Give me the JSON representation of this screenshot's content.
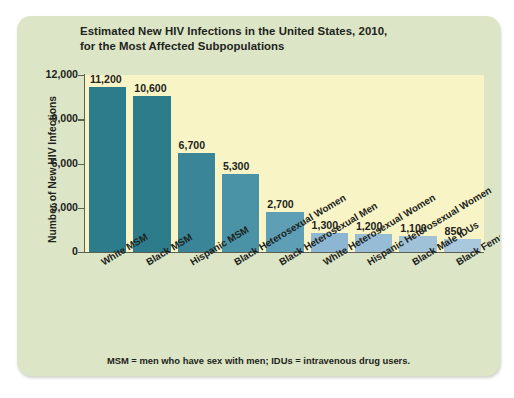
{
  "chart_data": {
    "type": "bar",
    "title": "Estimated New HIV Infections in the United States, 2010, for the Most Affected Subpopulations",
    "title_line1": "Estimated New HIV Infections in the United States, 2010,",
    "title_line2": "for the Most Affected Subpopulations",
    "xlabel": "",
    "ylabel": "Number of New HIV Infections",
    "ylim": [
      0,
      12000
    ],
    "grid": false,
    "legend": "none",
    "ytick_labels": [
      "12,000",
      "9,000",
      "6,000",
      "3,000",
      "0"
    ],
    "ytick_values": [
      12000,
      9000,
      6000,
      3000,
      0
    ],
    "categories": [
      "White MSM",
      "Black MSM",
      "Hispanic MSM",
      "Black Heterosexual Women",
      "Black Heterosexual Men",
      "White Heterosexual Women",
      "Hispanic Heterosexual Women",
      "Black Male IDUs",
      "Black Female IDUs"
    ],
    "values": [
      11200,
      10600,
      6700,
      5300,
      2700,
      1300,
      1200,
      1100,
      850
    ],
    "value_labels": [
      "11,200",
      "10,600",
      "6,700",
      "5,300",
      "2,700",
      "1,300",
      "1,200",
      "1,100",
      "850"
    ],
    "bar_colors": [
      "#2d7c8b",
      "#2d7c8b",
      "#3b8599",
      "#4a92a6",
      "#5e9fb6",
      "#8cb6d2",
      "#97bdd6",
      "#a0c2d9",
      "#a9c8de"
    ],
    "annotation": "MSM = men who have sex with men; IDUs = intravenous drug users."
  },
  "colors": {
    "card_background": "#dce5c6",
    "plot_background": "#f8f4c6",
    "axis": "#5d6154",
    "text": "#1d2420"
  }
}
